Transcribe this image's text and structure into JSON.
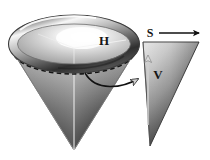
{
  "figure": {
    "background_color": "#ffffff"
  },
  "cone": {
    "name": "3d-cone",
    "labels": {
      "radius": "H"
    },
    "apex": {
      "x": 74,
      "y": 150
    },
    "rim_center": {
      "x": 74,
      "y": 47
    },
    "rim_radius_x": 64,
    "rim_radius_y": 26,
    "colors": {
      "rim_light": "#f2f2f2",
      "rim_dark": "#3a3a3a",
      "interior_light": "#ffffff",
      "body_light": "#c8c8c8",
      "body_dark": "#111111",
      "outline": "#2b2b2b",
      "axis_line": "#e8e8e8",
      "dashed_edge": "#1a1a1a"
    }
  },
  "cross_section": {
    "name": "triangle-cross-section",
    "labels": {
      "horizontal": "S",
      "vertical": "V"
    },
    "vertices": {
      "top_left": {
        "x": 143,
        "y": 42
      },
      "top_right": {
        "x": 199,
        "y": 42
      },
      "apex": {
        "x": 150,
        "y": 146
      }
    },
    "colors": {
      "fill_light": "#dcdcdc",
      "fill_dark": "#0d0d0d",
      "outline": "#2b2b2b",
      "arrow": "#555555"
    }
  },
  "arrows": {
    "s_arrow": {
      "name": "s-horizontal-arrow",
      "from": {
        "x": 159,
        "y": 33
      },
      "to": {
        "x": 201,
        "y": 33
      },
      "direction": "right",
      "color": "#1a1a1a"
    },
    "v_arrow": {
      "name": "v-vertical-arrow",
      "from": {
        "x": 148,
        "y": 125
      },
      "to": {
        "x": 148,
        "y": 53
      },
      "direction": "up",
      "color": "#c9c9c9"
    },
    "callout_arrow": {
      "name": "callout-curved-arrow",
      "from": {
        "x": 85,
        "y": 74
      },
      "to": {
        "x": 141,
        "y": 79
      },
      "direction": "right",
      "color": "#111111"
    }
  }
}
